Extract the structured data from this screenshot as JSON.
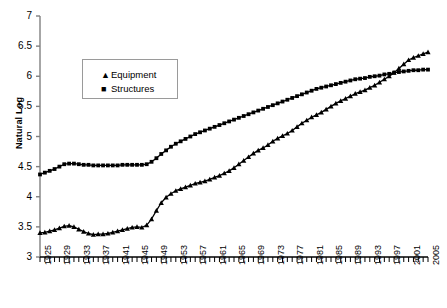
{
  "chart_data": {
    "type": "line",
    "title": "",
    "subtitle": "",
    "xlabel": "",
    "ylabel": "Natural Log",
    "xlim": [
      1925,
      2005
    ],
    "ylim": [
      3,
      7
    ],
    "yticks": [
      3,
      3.5,
      4,
      4.5,
      5,
      5.5,
      6,
      6.5,
      7
    ],
    "ytick_labels": [
      "3",
      "3.5",
      "4",
      "4.5",
      "5",
      "5.5",
      "6",
      "6.5",
      "7"
    ],
    "xtick_labels": [
      "1925",
      "1929",
      "1933",
      "1937",
      "1941",
      "1945",
      "1949",
      "1953",
      "1957",
      "1961",
      "1965",
      "1969",
      "1973",
      "1977",
      "1981",
      "1985",
      "1989",
      "1993",
      "1997",
      "2001",
      "2005"
    ],
    "xtick_step": 4,
    "grid": false,
    "legend_position": "upper-left",
    "legend": [
      {
        "name": "Equipment",
        "marker": "triangle"
      },
      {
        "name": "Structures",
        "marker": "square"
      }
    ],
    "x": [
      1925,
      1926,
      1927,
      1928,
      1929,
      1930,
      1931,
      1932,
      1933,
      1934,
      1935,
      1936,
      1937,
      1938,
      1939,
      1940,
      1941,
      1942,
      1943,
      1944,
      1945,
      1946,
      1947,
      1948,
      1949,
      1950,
      1951,
      1952,
      1953,
      1954,
      1955,
      1956,
      1957,
      1958,
      1959,
      1960,
      1961,
      1962,
      1963,
      1964,
      1965,
      1966,
      1967,
      1968,
      1969,
      1970,
      1971,
      1972,
      1973,
      1974,
      1975,
      1976,
      1977,
      1978,
      1979,
      1980,
      1981,
      1982,
      1983,
      1984,
      1985,
      1986,
      1987,
      1988,
      1989,
      1990,
      1991,
      1992,
      1993,
      1994,
      1995,
      1996,
      1997,
      1998,
      1999,
      2000,
      2001,
      2002,
      2003,
      2004,
      2005
    ],
    "series": [
      {
        "name": "Equipment",
        "marker": "triangle",
        "color": "#000000",
        "values": [
          3.4,
          3.41,
          3.43,
          3.45,
          3.48,
          3.51,
          3.52,
          3.5,
          3.46,
          3.42,
          3.39,
          3.37,
          3.38,
          3.38,
          3.39,
          3.41,
          3.43,
          3.45,
          3.47,
          3.49,
          3.5,
          3.49,
          3.53,
          3.63,
          3.77,
          3.9,
          3.99,
          4.05,
          4.1,
          4.13,
          4.16,
          4.19,
          4.22,
          4.24,
          4.26,
          4.29,
          4.32,
          4.35,
          4.39,
          4.43,
          4.48,
          4.54,
          4.6,
          4.66,
          4.72,
          4.77,
          4.81,
          4.86,
          4.92,
          4.97,
          5.01,
          5.05,
          5.1,
          5.16,
          5.22,
          5.27,
          5.32,
          5.36,
          5.4,
          5.45,
          5.5,
          5.55,
          5.59,
          5.63,
          5.67,
          5.71,
          5.74,
          5.77,
          5.81,
          5.85,
          5.9,
          5.95,
          6.0,
          6.06,
          6.13,
          6.2,
          6.27,
          6.31,
          6.34,
          6.37,
          6.4
        ]
      },
      {
        "name": "Structures",
        "marker": "square",
        "color": "#000000",
        "values": [
          4.37,
          4.4,
          4.43,
          4.46,
          4.5,
          4.54,
          4.55,
          4.55,
          4.54,
          4.53,
          4.53,
          4.52,
          4.52,
          4.52,
          4.52,
          4.52,
          4.52,
          4.53,
          4.53,
          4.53,
          4.53,
          4.53,
          4.54,
          4.58,
          4.64,
          4.71,
          4.77,
          4.83,
          4.88,
          4.92,
          4.96,
          5.0,
          5.04,
          5.07,
          5.1,
          5.13,
          5.16,
          5.19,
          5.22,
          5.25,
          5.28,
          5.31,
          5.34,
          5.37,
          5.4,
          5.43,
          5.46,
          5.49,
          5.52,
          5.55,
          5.58,
          5.61,
          5.64,
          5.67,
          5.7,
          5.73,
          5.76,
          5.79,
          5.81,
          5.83,
          5.85,
          5.87,
          5.89,
          5.91,
          5.93,
          5.95,
          5.96,
          5.97,
          5.99,
          6.0,
          6.01,
          6.03,
          6.04,
          6.06,
          6.07,
          6.08,
          6.09,
          6.1,
          6.1,
          6.11,
          6.11
        ]
      }
    ]
  }
}
